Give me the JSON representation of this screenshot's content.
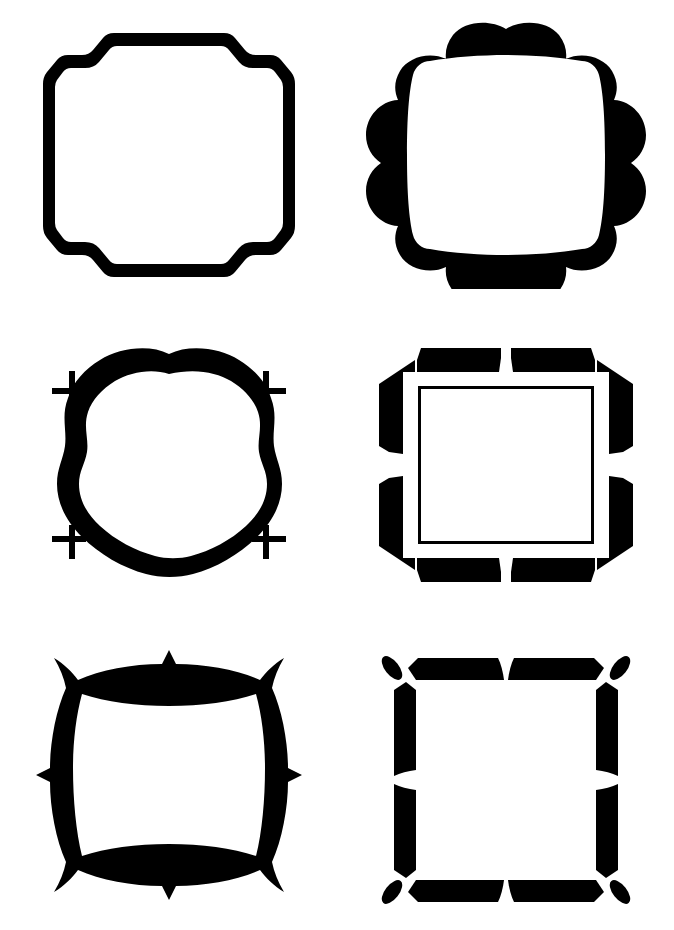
{
  "page": {
    "background_color": "#ffffff",
    "ink_color": "#000000",
    "width": 674,
    "height": 930,
    "layout": "2 columns x 3 rows grid of black silhouette frame clip-art"
  },
  "frames": [
    {
      "id": "frame-1",
      "position": "row 1, column 1",
      "name": "stepped-corner-octagon-frame",
      "description": "Square frame outline with two-step stair-cut notched corners, uniform stroke thickness, open white center",
      "bbox": {
        "x": 45,
        "y": 38,
        "width": 245,
        "height": 240
      },
      "fill": "#000000"
    },
    {
      "id": "frame-2",
      "position": "row 1, column 2",
      "name": "scalloped-cloud-frame",
      "description": "Cloud / scallop outer edge with two rounded bumps per side (eight lobes), rounded-square white opening inside",
      "bbox": {
        "x": 378,
        "y": 35,
        "width": 282,
        "height": 255
      },
      "fill": "#000000"
    },
    {
      "id": "frame-3",
      "position": "row 2, column 1",
      "name": "wavy-ring-crossbar-frame",
      "description": "Thick wavy circular ring with small crossbar tab stubs projecting at the four corners",
      "bbox": {
        "x": 45,
        "y": 340,
        "width": 245,
        "height": 238
      },
      "fill": "#000000"
    },
    {
      "id": "frame-4",
      "position": "row 2, column 2",
      "name": "octagon-split-border-frame",
      "description": "Solid octagonal border split by white wedge notches at the midpoint of each side, with a thin outlined inner square",
      "bbox": {
        "x": 390,
        "y": 345,
        "width": 250,
        "height": 230
      },
      "fill": "#000000"
    },
    {
      "id": "frame-5",
      "position": "row 3, column 1",
      "name": "curved-spur-point-frame",
      "description": "Sinuous curved band frame with hooked spurs at each corner and small diamond points at the midpoint of every side",
      "bbox": {
        "x": 35,
        "y": 635,
        "width": 260,
        "height": 253
      },
      "fill": "#000000"
    },
    {
      "id": "frame-6",
      "position": "row 3, column 2",
      "name": "segmented-leaf-corner-frame",
      "description": "Four detached tapered bar segments forming a square, with small almond leaf ornaments tucked into each corner gap",
      "bbox": {
        "x": 385,
        "y": 640,
        "width": 255,
        "height": 245
      },
      "fill": "#000000"
    }
  ]
}
